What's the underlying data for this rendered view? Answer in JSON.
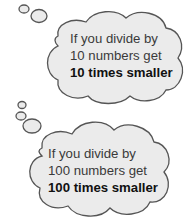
{
  "clouds": [
    {
      "line1": "If you divide by",
      "line2": "10 numbers get",
      "line3": "10 times smaller"
    },
    {
      "line1": "If you divide by",
      "line2": "100 numbers get",
      "line3": "100 times smaller"
    }
  ],
  "colors": {
    "cloud_fill": "#ebebeb",
    "cloud_stroke": "#555555",
    "text": "#3a3a3a"
  }
}
